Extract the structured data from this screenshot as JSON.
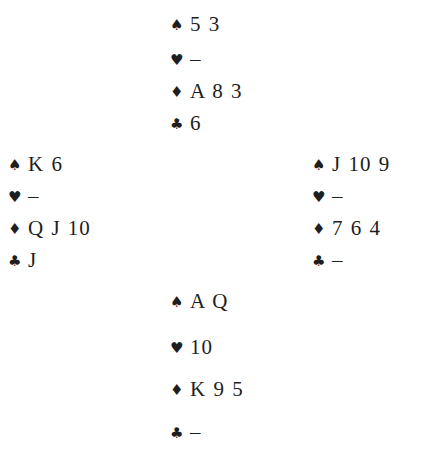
{
  "diagram": {
    "type": "bridge-deal",
    "suit_symbols": {
      "spades": "♠",
      "hearts": "♥",
      "diamonds": "♦",
      "clubs": "♣"
    },
    "hands": {
      "north": {
        "spades": "5 3",
        "hearts": "–",
        "diamonds": "A 8 3",
        "clubs": "6"
      },
      "west": {
        "spades": "K 6",
        "hearts": "–",
        "diamonds": "Q J 10",
        "clubs": "J"
      },
      "east": {
        "spades": "J 10 9",
        "hearts": "–",
        "diamonds": "7 6 4",
        "clubs": "–"
      },
      "south": {
        "spades": "A Q",
        "hearts": "10",
        "diamonds": "K 9 5",
        "clubs": "–"
      }
    }
  }
}
